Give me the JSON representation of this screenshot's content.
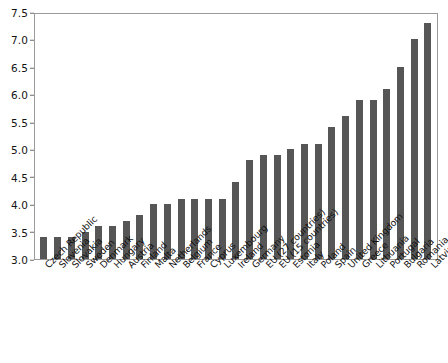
{
  "chart_data": {
    "type": "bar",
    "title": "",
    "subtitle": "",
    "xlabel": "",
    "ylabel": "",
    "ylim": [
      3.0,
      7.5
    ],
    "ytick_labels": [
      "7.5",
      "7.0",
      "6.5",
      "6.0",
      "5.5",
      "5.0",
      "4.5",
      "4.0",
      "3.5",
      "3.0"
    ],
    "ytick_values": [
      7.5,
      7.0,
      6.5,
      6.0,
      5.5,
      5.0,
      4.5,
      4.0,
      3.5,
      3.0
    ],
    "grid": false,
    "legend": false,
    "legend_position": "none",
    "bar_color": "#565656",
    "frame_color": "#9a9a9a",
    "categories": [
      "Czech Republic",
      "Slovenia",
      "Slovakia",
      "Sweden",
      "Denmark",
      "Hungary",
      "Austria",
      "Finland",
      "Malta",
      "Netherlands",
      "Belgium",
      "France",
      "Cyprus",
      "Luxembourg",
      "Ireland",
      "Germany",
      "EU (27 countries)",
      "EU (15 countries)",
      "Estonia",
      "Italy",
      "Poland",
      "Spain",
      "United Kingdom",
      "Greece",
      "Lithuania",
      "Portugal",
      "Bulgaria",
      "Romania",
      "Latvia"
    ],
    "values": [
      3.4,
      3.4,
      3.4,
      3.5,
      3.6,
      3.6,
      3.7,
      3.8,
      4.0,
      4.0,
      4.1,
      4.1,
      4.1,
      4.1,
      4.4,
      4.8,
      4.9,
      4.9,
      5.0,
      5.1,
      5.1,
      5.4,
      5.6,
      5.9,
      5.9,
      6.1,
      6.5,
      7.0,
      7.3
    ]
  }
}
